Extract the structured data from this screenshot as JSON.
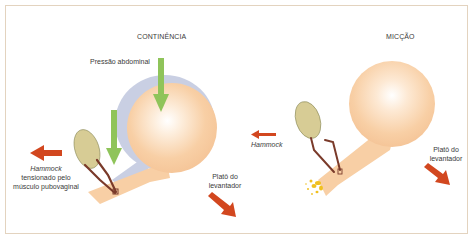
{
  "diagram": {
    "left_panel": {
      "title": "CONTINÊNCIA",
      "labels": {
        "abdominal_pressure": "Pressão abdominal",
        "hammock_line1": "Hammock",
        "hammock_line2": "tensionado pelo",
        "hammock_line3": "músculo pubovaginal",
        "levator_line1": "Platô do",
        "levator_line2": "levantador"
      }
    },
    "right_panel": {
      "title": "MICÇÃO",
      "labels": {
        "hammock": "Hammock",
        "levator_line1": "Platô do",
        "levator_line2": "levantador"
      }
    },
    "colors": {
      "bladder": "#f8cfa5",
      "bladder_highlight": "#ffffff",
      "abdomen": "#c9cfe3",
      "pubic_bone": "#d7cc95",
      "sling": "#7a3a2a",
      "pressure_arrow": "#8fc45a",
      "force_arrow": "#d2471f",
      "urine": "#f0c020",
      "frame": "#e3d3bf"
    }
  }
}
